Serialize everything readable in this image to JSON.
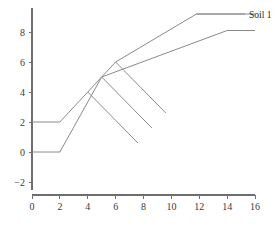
{
  "chart_data": {
    "type": "line",
    "title": "",
    "subtitle": "",
    "xlabel": "",
    "ylabel": "",
    "xlim": [
      0,
      16
    ],
    "ylim": [
      -2,
      9.6
    ],
    "xticks": [
      0,
      2,
      4,
      6,
      8,
      10,
      12,
      14,
      16
    ],
    "xtick_labels": [
      "0",
      "2",
      "4",
      "6",
      "8",
      "10",
      "12",
      "14",
      "16"
    ],
    "yticks": [
      -2,
      0,
      2,
      4,
      6,
      8
    ],
    "ytick_labels": [
      "-2",
      "0",
      "2",
      "4",
      "6",
      "8"
    ],
    "grid": false,
    "legend_position": "right-of-line-end",
    "line_color": "#8a8a8a",
    "axis_color": "#6e6e6e",
    "text_color": "#3a3a3a",
    "series": [
      {
        "name": "Soil 1",
        "label_shown": "Soil 1",
        "points": [
          {
            "x": 0,
            "y": 2.0
          },
          {
            "x": 2,
            "y": 2.0
          },
          {
            "x": 6,
            "y": 6.0
          },
          {
            "x": 11.8,
            "y": 9.2
          },
          {
            "x": 16,
            "y": 9.2
          }
        ]
      },
      {
        "name": "series-lower",
        "label_shown": "",
        "points": [
          {
            "x": 0,
            "y": 0.0
          },
          {
            "x": 2,
            "y": 0.0
          },
          {
            "x": 5,
            "y": 5.0
          },
          {
            "x": 14,
            "y": 8.1
          },
          {
            "x": 16,
            "y": 8.1
          }
        ]
      }
    ],
    "annotations": [
      {
        "name": "descending-stroke-1",
        "x1": 4.0,
        "y1": 4.0,
        "x2": 7.6,
        "y2": 0.6
      },
      {
        "name": "descending-stroke-2",
        "x1": 5.0,
        "y1": 5.0,
        "x2": 8.6,
        "y2": 1.6
      },
      {
        "name": "descending-stroke-3",
        "x1": 6.0,
        "y1": 6.0,
        "x2": 9.6,
        "y2": 2.6
      }
    ]
  },
  "labels": {
    "soil_1": "Soil 1"
  },
  "axes": {
    "x_title": "",
    "y_title": ""
  }
}
